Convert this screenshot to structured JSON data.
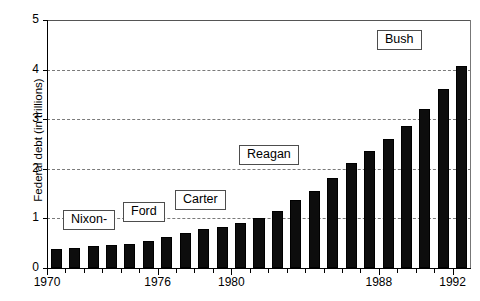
{
  "chart_data": {
    "type": "bar",
    "title": "",
    "xlabel": "",
    "ylabel": "Federal debt (in trillions)",
    "ylim": [
      0,
      5
    ],
    "xlim": [
      1970,
      1992
    ],
    "grid": true,
    "legend": "none",
    "y_ticks": [
      "0",
      "1",
      "2",
      "3",
      "4",
      "5"
    ],
    "y_tick_values": [
      0,
      1,
      2,
      3,
      4,
      5
    ],
    "x_tick_labels": [
      "1970",
      "1976",
      "1980",
      "1988",
      "1992"
    ],
    "x_tick_values": [
      1970,
      1976,
      1980,
      1988,
      1992
    ],
    "categories": [
      "1970",
      "1971",
      "1972",
      "1973",
      "1974",
      "1975",
      "1976",
      "1977",
      "1978",
      "1979",
      "1980",
      "1981",
      "1982",
      "1983",
      "1984",
      "1985",
      "1986",
      "1987",
      "1988",
      "1989",
      "1990",
      "1991",
      "1992"
    ],
    "values": [
      0.38,
      0.41,
      0.44,
      0.46,
      0.48,
      0.54,
      0.63,
      0.71,
      0.78,
      0.83,
      0.91,
      1.0,
      1.14,
      1.37,
      1.56,
      1.82,
      2.12,
      2.35,
      2.6,
      2.87,
      3.21,
      3.6,
      4.08
    ],
    "bar_color": "#0d0d0d",
    "annotations": [
      {
        "label": "Nixon-",
        "name": "era-label-nixon"
      },
      {
        "label": "Ford",
        "name": "era-label-ford"
      },
      {
        "label": "Carter",
        "name": "era-label-carter"
      },
      {
        "label": "Reagan",
        "name": "era-label-reagan"
      },
      {
        "label": "Bush",
        "name": "era-label-bush"
      }
    ]
  }
}
